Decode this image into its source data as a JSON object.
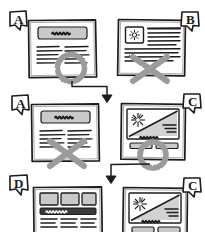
{
  "sketch": {
    "title": "Hand-drawn A/B test wireframe decision sketch",
    "ink_color": "#1c1c1c",
    "marker_color": "#9b9b9b",
    "fill_gray": "#c9c9c9",
    "fill_dark": "#3a3a3a",
    "paper_color": "#ffffff",
    "stroke_style": "hand-drawn-pencil"
  },
  "panels": [
    {
      "id": "panel-a-row1",
      "label": "A",
      "row": 1,
      "column": "left",
      "layout": "hero-banner-with-two-text-columns",
      "verdict": "winner",
      "verdict_mark": "circle",
      "elements": [
        {
          "type": "filled-banner",
          "name": "hero-banner",
          "scribble_text": "Lorem ipsum"
        },
        {
          "type": "text-lines",
          "name": "text-column-left",
          "lines": 4
        },
        {
          "type": "text-lines",
          "name": "text-column-right",
          "lines": 4
        }
      ]
    },
    {
      "id": "panel-b-row1",
      "label": "B",
      "row": 1,
      "column": "right",
      "layout": "icon-tile-with-paragraph-block",
      "verdict": "loser",
      "verdict_mark": "cross",
      "elements": [
        {
          "type": "icon-tile",
          "name": "sunburst-icon-tile",
          "icon": "sunburst-icon"
        },
        {
          "type": "text-lines",
          "name": "paragraph-block",
          "lines": 5
        },
        {
          "type": "text-lines",
          "name": "footer-lines",
          "lines": 4
        }
      ]
    },
    {
      "id": "panel-a-row2",
      "label": "A",
      "row": 2,
      "column": "left",
      "layout": "hero-banner-with-two-text-columns",
      "verdict": "loser",
      "verdict_mark": "cross",
      "elements": [
        {
          "type": "filled-banner",
          "name": "hero-banner",
          "scribble_text": "Lorem ipsum"
        },
        {
          "type": "text-lines",
          "name": "text-column-left",
          "lines": 4
        },
        {
          "type": "text-lines",
          "name": "text-column-right",
          "lines": 4
        }
      ]
    },
    {
      "id": "panel-c-row2",
      "label": "C",
      "row": 2,
      "column": "right",
      "layout": "diagonal-hero-with-two-buttons",
      "verdict": "winner",
      "verdict_mark": "circle",
      "elements": [
        {
          "type": "diagonal-hero",
          "name": "diagonal-hero-image",
          "icon": "starburst-icon"
        },
        {
          "type": "text-lines",
          "name": "hero-caption-lines",
          "lines": 3
        },
        {
          "type": "scribble-text",
          "name": "headline-scribble",
          "scribble_text": "Lorem ipsum dolor"
        },
        {
          "type": "button",
          "name": "cta-button-primary"
        },
        {
          "type": "button",
          "name": "cta-button-secondary"
        }
      ]
    },
    {
      "id": "panel-d-row3",
      "label": "D",
      "row": 3,
      "column": "left",
      "layout": "three-card-grid-with-nav-bar",
      "verdict": "none",
      "verdict_mark": "none",
      "elements": [
        {
          "type": "image-card",
          "name": "image-card-1"
        },
        {
          "type": "image-card",
          "name": "image-card-2"
        },
        {
          "type": "image-card",
          "name": "image-card-3"
        },
        {
          "type": "dark-nav-bar",
          "name": "nav-bar",
          "scribble_text": "menu items"
        },
        {
          "type": "text-lines",
          "name": "text-column-1",
          "lines": 3
        },
        {
          "type": "text-lines",
          "name": "text-column-2",
          "lines": 3
        },
        {
          "type": "text-lines",
          "name": "text-column-3",
          "lines": 3
        }
      ]
    },
    {
      "id": "panel-c-row3",
      "label": "C",
      "row": 3,
      "column": "right",
      "layout": "diagonal-hero-with-two-buttons",
      "verdict": "none",
      "verdict_mark": "none",
      "elements": [
        {
          "type": "diagonal-hero",
          "name": "diagonal-hero-image",
          "icon": "starburst-icon"
        },
        {
          "type": "text-lines",
          "name": "hero-caption-lines",
          "lines": 3
        },
        {
          "type": "scribble-text",
          "name": "headline-scribble",
          "scribble_text": "Lorem ipsum dolor"
        },
        {
          "type": "button",
          "name": "cta-button-primary"
        },
        {
          "type": "button",
          "name": "cta-button-secondary"
        }
      ]
    }
  ],
  "connectors": [
    {
      "id": "arrow-row1-to-row2",
      "name": "flow-arrow-down-1",
      "from": "panel-a-row1",
      "to": "row-2",
      "shape": "elbow-down-arrow"
    },
    {
      "id": "arrow-row2-to-row3",
      "name": "flow-arrow-down-2",
      "from": "panel-c-row2",
      "to": "row-3",
      "shape": "elbow-down-arrow"
    }
  ],
  "labels": {
    "a1": "A",
    "b1": "B",
    "a2": "A",
    "c2": "C",
    "d3": "D",
    "c3": "C"
  }
}
